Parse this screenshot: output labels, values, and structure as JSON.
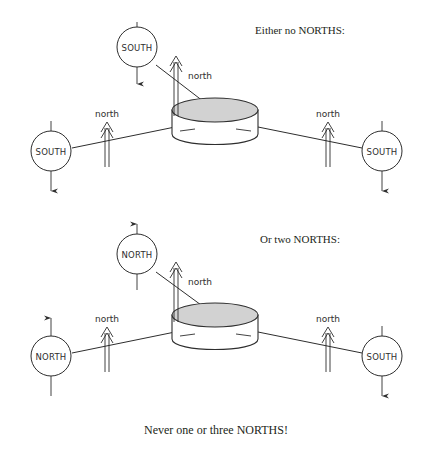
{
  "figure": {
    "background_color": "#ffffff",
    "line_color": "#2e2e2e",
    "disc_fill_color": "#d2d2d2"
  },
  "headings": {
    "top": "Either no NORTHS:",
    "middle": "Or two NORTHS:"
  },
  "caption": {
    "bottom": "Never one or three NORTHS!"
  },
  "labels": {
    "north_flux": "north",
    "south_pole": "SOUTH",
    "north_pole": "NORTH"
  },
  "panels": [
    {
      "id": "panel-top",
      "heading": "Either no NORTHS:",
      "magnets": [
        {
          "id": "top-magnet",
          "pole": "SOUTH",
          "arrow_direction": "down"
        },
        {
          "id": "left-magnet",
          "pole": "SOUTH",
          "arrow_direction": "down"
        },
        {
          "id": "right-magnet",
          "pole": "SOUTH",
          "arrow_direction": "down"
        }
      ],
      "flux_arrows": [
        {
          "id": "flux-top",
          "label": "north",
          "direction": "up"
        },
        {
          "id": "flux-left",
          "label": "north",
          "direction": "up"
        },
        {
          "id": "flux-right",
          "label": "north",
          "direction": "up"
        }
      ],
      "disc": {
        "id": "disc-top",
        "shape": "cylinder",
        "fill": "#d2d2d2"
      }
    },
    {
      "id": "panel-bottom",
      "heading": "Or two NORTHS:",
      "magnets": [
        {
          "id": "top-magnet",
          "pole": "NORTH",
          "arrow_direction": "up"
        },
        {
          "id": "left-magnet",
          "pole": "NORTH",
          "arrow_direction": "up"
        },
        {
          "id": "right-magnet",
          "pole": "SOUTH",
          "arrow_direction": "down"
        }
      ],
      "flux_arrows": [
        {
          "id": "flux-top",
          "label": "north",
          "direction": "up"
        },
        {
          "id": "flux-left",
          "label": "north",
          "direction": "up"
        },
        {
          "id": "flux-right",
          "label": "north",
          "direction": "up"
        }
      ],
      "disc": {
        "id": "disc-bottom",
        "shape": "cylinder",
        "fill": "#d2d2d2"
      }
    }
  ]
}
